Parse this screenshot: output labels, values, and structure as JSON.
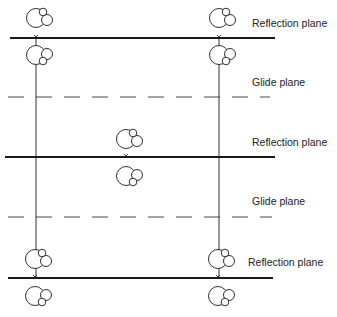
{
  "diagram": {
    "type": "crystal-symmetry-planes",
    "colors": {
      "line": "#1a1a1a",
      "background": "#ffffff",
      "text": "#222222"
    },
    "labels": [
      {
        "id": "reflection-1",
        "text": "Reflection plane",
        "x": 252,
        "y": 23
      },
      {
        "id": "glide-1",
        "text": "Glide plane",
        "x": 252,
        "y": 82
      },
      {
        "id": "reflection-2",
        "text": "Reflection plane",
        "x": 252,
        "y": 142
      },
      {
        "id": "glide-2",
        "text": "Glide plane",
        "x": 252,
        "y": 201
      },
      {
        "id": "reflection-3",
        "text": "Reflection plane",
        "x": 248,
        "y": 262
      }
    ],
    "reflection_planes": [
      {
        "y": 38,
        "x1": 10,
        "x2": 275
      },
      {
        "y": 157,
        "x1": 5,
        "x2": 275
      },
      {
        "y": 278,
        "x1": 8,
        "x2": 273
      }
    ],
    "glide_planes": [
      {
        "y": 97,
        "x1": 8,
        "x2": 270,
        "underline_x1": 250,
        "underline_x2": 273
      },
      {
        "y": 217,
        "x1": 8,
        "x2": 272,
        "underline_x1": 250,
        "underline_x2": 273
      }
    ],
    "vertical_lines": [
      {
        "x": 36,
        "y1": 38,
        "y2": 278
      },
      {
        "x": 219,
        "y1": 38,
        "y2": 278
      }
    ],
    "molecules": [
      {
        "cx": 36,
        "cy": 18,
        "orientation": "up"
      },
      {
        "cx": 36,
        "cy": 55,
        "orientation": "down"
      },
      {
        "cx": 219,
        "cy": 18,
        "orientation": "up"
      },
      {
        "cx": 219,
        "cy": 55,
        "orientation": "down"
      },
      {
        "cx": 126,
        "cy": 139,
        "orientation": "up"
      },
      {
        "cx": 126,
        "cy": 176,
        "orientation": "down"
      },
      {
        "cx": 35,
        "cy": 259,
        "orientation": "up"
      },
      {
        "cx": 35,
        "cy": 296,
        "orientation": "down"
      },
      {
        "cx": 218,
        "cy": 259,
        "orientation": "up"
      },
      {
        "cx": 218,
        "cy": 296,
        "orientation": "down"
      }
    ],
    "cross_markers": [
      {
        "x": 36,
        "y": 38
      },
      {
        "x": 219,
        "y": 38
      },
      {
        "x": 126,
        "y": 157
      },
      {
        "x": 35,
        "y": 278
      },
      {
        "x": 218,
        "y": 278
      }
    ]
  }
}
